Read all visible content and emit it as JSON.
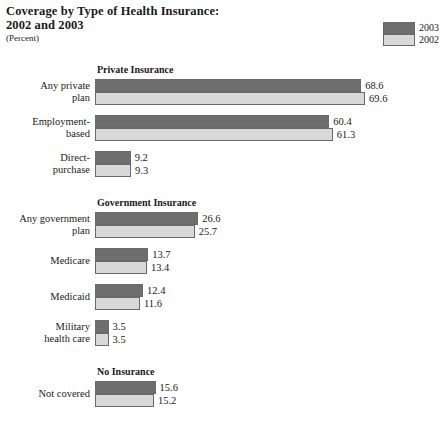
{
  "title": "Coverage by Type of Health Insurance:\n2002 and 2003",
  "title_line1": "Coverage by Type of Health Insurance:",
  "title_line2": "2002 and 2003",
  "subtitle": "(Percent)",
  "legend": {
    "items": [
      {
        "label": "2003",
        "color": "#6e6e6e"
      },
      {
        "label": "2002",
        "color": "#d8d8d8"
      }
    ]
  },
  "sections": [
    {
      "heading": "Private Insurance",
      "groups": [
        {
          "label_line1": "Any private",
          "label_line2": "plan",
          "v2003": 68.6,
          "v2002": 69.6
        },
        {
          "label_line1": "Employment-",
          "label_line2": "based",
          "v2003": 60.4,
          "v2002": 61.3
        },
        {
          "label_line1": "Direct-",
          "label_line2": "purchase",
          "v2003": 9.2,
          "v2002": 9.3
        }
      ]
    },
    {
      "heading": "Government Insurance",
      "groups": [
        {
          "label_line1": "Any government",
          "label_line2": "plan",
          "v2003": 26.6,
          "v2002": 25.7
        },
        {
          "label_line1": "Medicare",
          "label_line2": "",
          "v2003": 13.7,
          "v2002": 13.4
        },
        {
          "label_line1": "Medicaid",
          "label_line2": "",
          "v2003": 12.4,
          "v2002": 11.6
        },
        {
          "label_line1": "Military",
          "label_line2": "health care",
          "v2003": 3.5,
          "v2002": 3.5
        }
      ]
    },
    {
      "heading": "No Insurance",
      "groups": [
        {
          "label_line1": "Not covered",
          "label_line2": "",
          "v2003": 15.6,
          "v2002": 15.2
        }
      ]
    }
  ],
  "chart_data": {
    "type": "bar",
    "orientation": "horizontal",
    "title": "Coverage by Type of Health Insurance: 2002 and 2003",
    "subtitle": "(Percent)",
    "xlabel": "Percent",
    "ylabel": "",
    "xlim": [
      0,
      70
    ],
    "grid": false,
    "legend_position": "top-right",
    "categories": [
      "Any private plan",
      "Employment-based",
      "Direct-purchase",
      "Any government plan",
      "Medicare",
      "Medicaid",
      "Military health care",
      "Not covered"
    ],
    "group_headings": [
      "Private Insurance",
      "Government Insurance",
      "No Insurance"
    ],
    "series": [
      {
        "name": "2003",
        "color": "#6e6e6e",
        "values": [
          68.6,
          60.4,
          9.2,
          26.6,
          13.7,
          12.4,
          3.5,
          15.6
        ]
      },
      {
        "name": "2002",
        "color": "#d8d8d8",
        "values": [
          69.6,
          61.3,
          9.3,
          25.7,
          13.4,
          11.6,
          3.5,
          15.2
        ]
      }
    ]
  }
}
